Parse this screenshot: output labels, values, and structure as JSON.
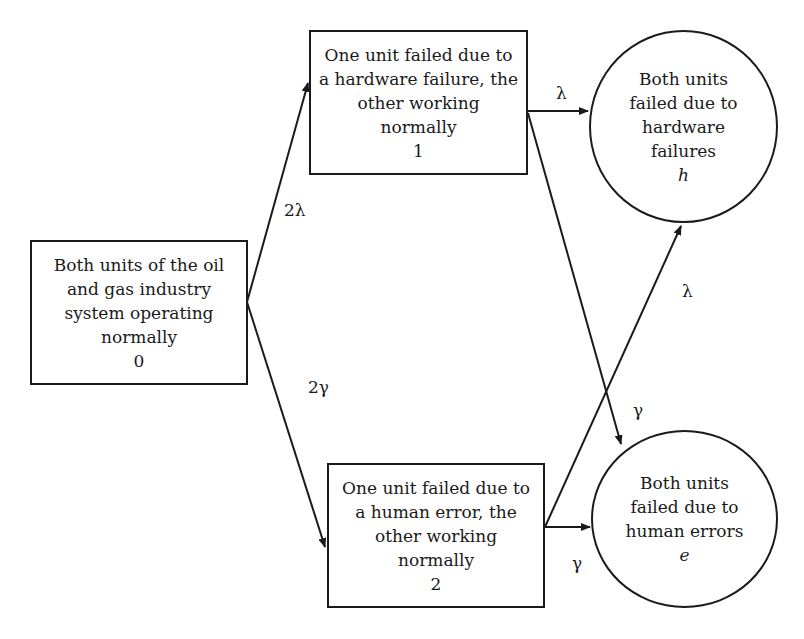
{
  "diagram": {
    "type": "state-transition",
    "nodes": [
      {
        "id": "0",
        "shape": "rectangle",
        "lines": [
          "Both units of the oil",
          "and gas industry",
          "system operating",
          "normally"
        ],
        "state_label": "0"
      },
      {
        "id": "1",
        "shape": "rectangle",
        "lines": [
          "One unit failed due to",
          "a hardware failure, the",
          "other working",
          "normally"
        ],
        "state_label": "1"
      },
      {
        "id": "2",
        "shape": "rectangle",
        "lines": [
          "One unit failed due to",
          "a human error, the",
          "other working",
          "normally"
        ],
        "state_label": "2"
      },
      {
        "id": "h",
        "shape": "circle",
        "lines": [
          "Both units",
          "failed due to",
          "hardware",
          "failures"
        ],
        "state_label": "h"
      },
      {
        "id": "e",
        "shape": "circle",
        "lines": [
          "Both units",
          "failed due to",
          "human errors"
        ],
        "state_label": "e"
      }
    ],
    "edges": [
      {
        "from": "0",
        "to": "1",
        "label": "2λ"
      },
      {
        "from": "0",
        "to": "2",
        "label": "2γ"
      },
      {
        "from": "1",
        "to": "h",
        "label": "λ"
      },
      {
        "from": "1",
        "to": "e",
        "label": "γ"
      },
      {
        "from": "2",
        "to": "h",
        "label": "λ"
      },
      {
        "from": "2",
        "to": "e",
        "label": "γ"
      }
    ]
  }
}
